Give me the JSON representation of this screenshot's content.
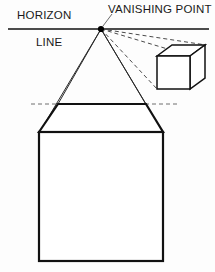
{
  "figure": {
    "background_color": "#fdfdfd",
    "ink_color": "#111111",
    "guide_color": "#6e6e6e",
    "width": 215,
    "height": 272
  },
  "labels": {
    "horizon": "HORIZON",
    "line": "LINE",
    "vanishing_point": "VANISHING POINT"
  },
  "horizon_line": {
    "name": "horizon-line",
    "y": 29,
    "x_start": 8,
    "x_end": 209,
    "stroke_width": 1.3
  },
  "vanishing_point": {
    "name": "vanishing-point-dot",
    "x": 101,
    "y": 29,
    "radius": 3.1
  },
  "pointer": {
    "name": "label-leader-line",
    "x1": 112,
    "y1": 14,
    "x2": 103,
    "y2": 26
  },
  "large_box": {
    "name": "large-cube",
    "front_face": {
      "left": 39,
      "top": 132,
      "right": 163,
      "bottom": 261
    },
    "back_top_left": {
      "x": 58,
      "y": 104
    },
    "back_top_right": {
      "x": 146,
      "y": 104
    },
    "stroke_width": 2.2
  },
  "small_box": {
    "name": "small-cube",
    "front_face": {
      "left": 157,
      "top": 56,
      "right": 190,
      "bottom": 89
    },
    "back_top_left": {
      "x": 172,
      "y": 45
    },
    "back_top_right": {
      "x": 205,
      "y": 45
    },
    "back_bottom_right": {
      "x": 205,
      "y": 78
    },
    "stroke_width": 1.5
  },
  "construction_rays": {
    "solid": [
      {
        "name": "ray-to-large-box-front-top-left",
        "x2": 39,
        "y2": 132
      },
      {
        "name": "ray-to-large-box-front-top-right",
        "x2": 163,
        "y2": 132
      },
      {
        "name": "ray-to-large-box-back-top-left",
        "x2": 58,
        "y2": 104
      },
      {
        "name": "ray-to-large-box-back-top-right",
        "x2": 146,
        "y2": 104
      }
    ],
    "dashed": [
      {
        "name": "ray-to-small-box-back-top-left",
        "x2": 172,
        "y2": 45
      },
      {
        "name": "ray-to-small-box-front-top-left",
        "x2": 157,
        "y2": 56
      },
      {
        "name": "ray-to-small-box-front-bottom-left",
        "x2": 157,
        "y2": 89
      }
    ],
    "dash_pattern": "4 3"
  },
  "dashed_guides": [
    {
      "name": "back-plane-guide-left",
      "x1": 31,
      "y1": 104,
      "x2": 58,
      "y2": 104
    },
    {
      "name": "back-plane-guide-right",
      "x1": 146,
      "y1": 104,
      "x2": 178,
      "y2": 104
    }
  ]
}
